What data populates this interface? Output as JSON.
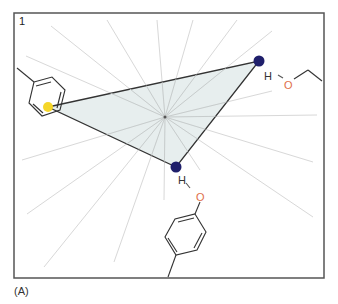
{
  "figure": {
    "panel_number": "1",
    "panel_caption": "(A)",
    "frame": {
      "x": 14,
      "y": 13,
      "width": 310,
      "height": 265,
      "stroke": "#555555"
    },
    "colors": {
      "ray": "#d8d8d8",
      "triangle_fill": "#e3ebeb",
      "triangle_stroke": "#333333",
      "bond": "#333333",
      "oxygen": "#e0704a",
      "hydrogen": "#333333",
      "donor_atom": "#1f1f6b",
      "aromatic_center": "#f5d629"
    },
    "center": {
      "x": 165,
      "y": 117
    },
    "rays": [
      [
        51,
        26
      ],
      [
        107,
        20
      ],
      [
        157,
        20
      ],
      [
        26,
        56
      ],
      [
        193,
        20
      ],
      [
        237,
        20
      ],
      [
        272,
        31
      ],
      [
        272,
        91
      ],
      [
        317,
        115
      ],
      [
        22,
        160
      ],
      [
        27,
        214
      ],
      [
        44,
        267
      ],
      [
        114,
        262
      ],
      [
        164,
        200
      ],
      [
        313,
        162
      ],
      [
        313,
        217
      ],
      [
        200,
        170
      ]
    ],
    "triangle": {
      "vertices": [
        [
          48,
          107
        ],
        [
          259,
          61
        ],
        [
          176,
          167
        ]
      ]
    },
    "atoms": {
      "aromatic_center": {
        "x": 48,
        "y": 107,
        "r": 5,
        "label": "aromatic-ring-centroid"
      },
      "donor_top": {
        "x": 259,
        "y": 61,
        "r": 5.5,
        "label": "hydrogen-bond-donor"
      },
      "donor_bottom": {
        "x": 176,
        "y": 167,
        "r": 5.5,
        "label": "hydrogen-bond-donor"
      }
    },
    "labels": {
      "h_top": "H",
      "o_top": "O",
      "h_bottom": "H",
      "o_bottom": "O"
    }
  }
}
